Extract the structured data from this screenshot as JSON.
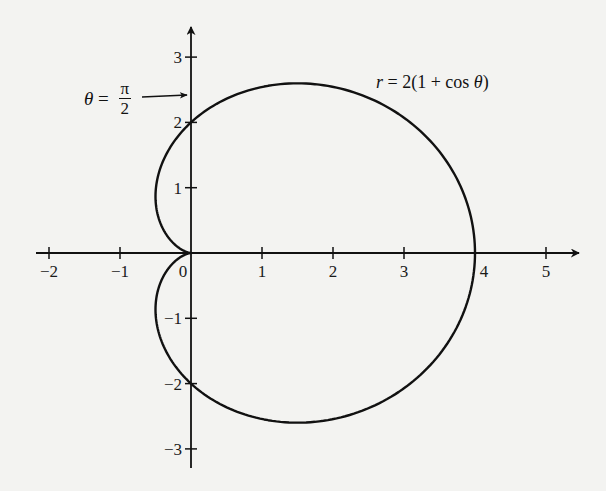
{
  "chart_data": {
    "type": "line",
    "subtype": "polar-curve",
    "title": "",
    "equation": "r = 2(1 + cos θ)",
    "xlabel": "",
    "ylabel": "",
    "xlim": [
      -2.2,
      5.5
    ],
    "ylim": [
      -3.3,
      3.4
    ],
    "grid": false,
    "x_ticks": [
      -2,
      -1,
      0,
      1,
      2,
      3,
      4,
      5
    ],
    "x_tick_labels": [
      "−2",
      "−1",
      "0",
      "1",
      "2",
      "3",
      "4",
      "5"
    ],
    "y_ticks": [
      -3,
      -2,
      -1,
      1,
      2,
      3
    ],
    "y_tick_labels": [
      "−3",
      "−2",
      "−1",
      "1",
      "2",
      "3"
    ],
    "series": [
      {
        "name": "r = 2(1 + cos θ)",
        "curve": "cardioid",
        "a": 2,
        "key_points": [
          {
            "theta": "0",
            "x": 4,
            "y": 0
          },
          {
            "theta": "π/3",
            "x": 1.5,
            "y": 2.598
          },
          {
            "theta": "π/2",
            "x": 0,
            "y": 2
          },
          {
            "theta": "2π/3",
            "x": -0.5,
            "y": 0.866
          },
          {
            "theta": "π",
            "x": 0,
            "y": 0
          },
          {
            "theta": "4π/3",
            "x": -0.5,
            "y": -0.866
          },
          {
            "theta": "3π/2",
            "x": 0,
            "y": -2
          },
          {
            "theta": "5π/3",
            "x": 1.5,
            "y": -2.598
          }
        ]
      }
    ],
    "annotations": [
      {
        "text": "r = 2(1 + cos θ)",
        "position": "upper right of curve"
      },
      {
        "text": "θ = π/2",
        "arrow_to": [
          0,
          2.45
        ]
      }
    ]
  },
  "labels": {
    "equation": {
      "lhs": "r",
      "eq": " = 2(1 + cos ",
      "theta": "θ",
      "close": ")"
    },
    "theta_annotation": {
      "theta": "θ",
      "eq": " = ",
      "num": "π",
      "den": "2"
    }
  },
  "style": {
    "line_color": "#111111",
    "background": "#f3f3f1"
  }
}
